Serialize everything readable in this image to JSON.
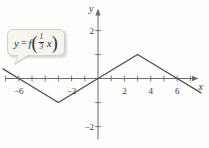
{
  "figure": {
    "background": "#fdfdfb"
  },
  "callout": {
    "equation": {
      "lhs_y": "y",
      "equals": "=",
      "func": "f",
      "open_paren": "(",
      "close_paren": ")",
      "fraction": {
        "numerator": "1",
        "denominator": "3"
      },
      "argument": "x"
    }
  },
  "chart_data": {
    "type": "line",
    "title": "",
    "xlabel": "x",
    "ylabel": "y",
    "xlim": [
      -7.4,
      7.9
    ],
    "ylim": [
      -2.9,
      2.9
    ],
    "grid": false,
    "legend": "none",
    "axis_color": "#6a6a6a",
    "line_color": "#4c4c4c",
    "label_color": "#3a3a3a",
    "x_ticks": [
      -7,
      -6,
      -5,
      -4,
      -3,
      -2,
      -1,
      1,
      2,
      3,
      4,
      5,
      6,
      7
    ],
    "y_ticks": [
      -2,
      -1,
      1,
      2
    ],
    "x_tick_labels": [
      {
        "value": -6,
        "label": "−6"
      },
      {
        "value": -2,
        "label": "−2"
      },
      {
        "value": 2,
        "label": "2"
      },
      {
        "value": 4,
        "label": "4"
      },
      {
        "value": 6,
        "label": "6"
      }
    ],
    "y_tick_labels": [
      {
        "value": 2,
        "label": "2"
      },
      {
        "value": -2,
        "label": "−2"
      }
    ],
    "series": [
      {
        "name": "y = f((1/3)x)",
        "points": [
          [
            -7.2,
            0.4
          ],
          [
            -6,
            0
          ],
          [
            -3,
            -1
          ],
          [
            0,
            0
          ],
          [
            3,
            1
          ],
          [
            6,
            0
          ],
          [
            7.8,
            -0.6
          ]
        ]
      }
    ]
  }
}
